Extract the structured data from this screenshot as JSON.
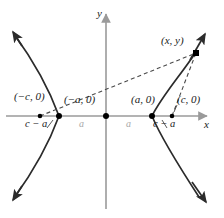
{
  "figure": {
    "colors": {
      "curve": "#2b2b2b",
      "axis": "#9a9a9a",
      "dashed": "#4a4a4a",
      "point": "#000000",
      "label": "#1a1a1a",
      "dim_label": "#a8a8a8",
      "background": "#ffffff"
    },
    "axes": {
      "x_label": "x",
      "y_label": "y",
      "origin_x": 106,
      "origin_y": 116
    },
    "points": [
      {
        "id": "left-focus",
        "label": "(−c, 0)",
        "x": 40,
        "y": 116,
        "r": 2.3,
        "label_x": 14,
        "label_y": 97
      },
      {
        "id": "left-vertex",
        "label": "(−a, 0)",
        "x": 59,
        "y": 116,
        "r": 3.0,
        "label_x": 64,
        "label_y": 100
      },
      {
        "id": "origin",
        "label": "",
        "x": 106,
        "y": 116,
        "r": 3.0,
        "label_x": 0,
        "label_y": 0
      },
      {
        "id": "right-vertex",
        "label": "(a, 0)",
        "x": 152,
        "y": 116,
        "r": 3.0,
        "label_x": 131,
        "label_y": 100
      },
      {
        "id": "right-focus",
        "label": "(c, 0)",
        "x": 172,
        "y": 116,
        "r": 2.3,
        "label_x": 177,
        "label_y": 100
      },
      {
        "id": "curve-point",
        "label": "(x, y)",
        "x": 196,
        "y": 53,
        "r": 3.2,
        "label_x": 162,
        "label_y": 41
      }
    ],
    "segment_labels": [
      {
        "id": "left-c-minus-a",
        "text": "c − a",
        "x": 28,
        "y": 121
      },
      {
        "id": "right-c-minus-a",
        "text": "c − a",
        "x": 155,
        "y": 121
      },
      {
        "id": "left-a",
        "text": "a",
        "x": 80,
        "y": 121
      },
      {
        "id": "right-a",
        "text": "a",
        "x": 127,
        "y": 121
      }
    ],
    "dashed_lines": [
      {
        "id": "focal-radius-from-left-focus",
        "x1": 40,
        "y1": 116,
        "x2": 196,
        "y2": 53
      },
      {
        "id": "focal-radius-from-right-focus",
        "x1": 172,
        "y1": 116,
        "x2": 196,
        "y2": 53
      }
    ]
  }
}
